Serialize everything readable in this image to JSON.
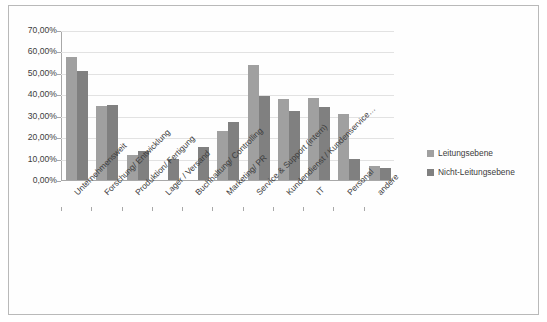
{
  "chart_data": {
    "type": "bar",
    "title": "",
    "subtitle": "",
    "xlabel": "",
    "ylabel": "",
    "ylim": [
      0,
      70
    ],
    "grid": true,
    "legend_position": "right",
    "yticks": [
      "0,00%",
      "10,00%",
      "20,00%",
      "30,00%",
      "40,00%",
      "50,00%",
      "60,00%",
      "70,00%"
    ],
    "ytick_values": [
      0,
      10,
      20,
      30,
      40,
      50,
      60,
      70
    ],
    "categories": [
      "Unternehmensweit",
      "Forschung/ Entwicklung",
      "Produktion/ Fertigung",
      "Lager / Versand",
      "Buchhaltung/ Controlling",
      "Marketing/ PR",
      "Service & Support (intern)",
      "Kundendienst / Kundenservice…",
      "IT",
      "Personal",
      "andere"
    ],
    "series": [
      {
        "name": "Leitungsebene",
        "color": "#a0a0a0",
        "values": [
          57.5,
          34.5,
          11.5,
          0,
          0,
          23.0,
          53.5,
          38.0,
          38.5,
          31.0,
          6.5
        ]
      },
      {
        "name": "Nicht-Leitungsebene",
        "color": "#808080",
        "values": [
          51.0,
          35.2,
          13.7,
          9.8,
          15.5,
          27.3,
          39.0,
          32.0,
          34.0,
          10.0,
          5.5
        ]
      }
    ]
  }
}
